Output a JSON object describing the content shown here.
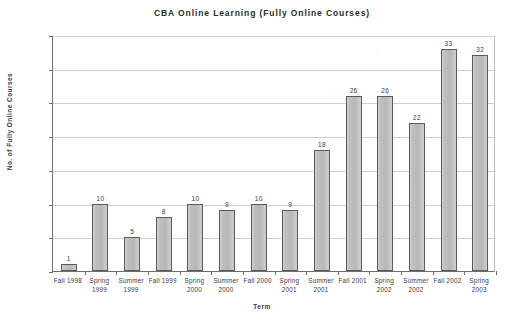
{
  "chart_data": {
    "type": "bar",
    "title": "CBA Online Learning (Fully Online Courses)",
    "xlabel": "Term",
    "ylabel": "No. of Fully Online Courses",
    "categories": [
      "Fall 1998",
      "Spring 1999",
      "Summer 1999",
      "Fall 1999",
      "Spring 2000",
      "Summer 2000",
      "Fall 2000",
      "Spring 2001",
      "Summer 2001",
      "Fall 2001",
      "Spring 2002",
      "Summer 2002",
      "Fall 2002",
      "Spring 2003"
    ],
    "values": [
      1,
      10,
      5,
      8,
      10,
      9,
      10,
      9,
      18,
      26,
      26,
      22,
      33,
      32
    ],
    "data_labels": [
      "1",
      "10",
      "5",
      "8",
      "10",
      "9",
      "10",
      "9",
      "18",
      "26",
      "26",
      "22",
      "33",
      "32"
    ],
    "ylim": [
      0,
      35
    ],
    "ytick_values": [
      0,
      5,
      10,
      15,
      20,
      25,
      30,
      35
    ],
    "ytick_labels": [
      "0",
      "5",
      "10",
      "15",
      "20",
      "25",
      "30",
      "35"
    ],
    "grid": "horizontal",
    "legend": "none",
    "bar_color": "#bfbfbf",
    "bar_border_color": "#5a5a5a",
    "grid_color": "#cfcfcf",
    "axis_color": "#6e6e6e",
    "text_color": "#3a3a3a"
  }
}
